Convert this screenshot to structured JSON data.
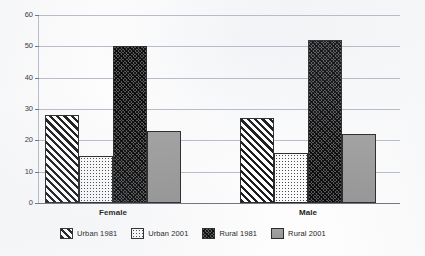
{
  "chart_data": {
    "type": "bar",
    "title": "",
    "subtitle": "",
    "xlabel": "",
    "ylabel": "",
    "categories": [
      "Female",
      "Male"
    ],
    "series": [
      {
        "name": "Urban 1981",
        "values": [
          28,
          27
        ],
        "pattern": "diagonal-hatch",
        "color": "#ffffff"
      },
      {
        "name": "Urban 2001",
        "values": [
          15,
          16
        ],
        "pattern": "fine-dots",
        "color": "#fbfbfb"
      },
      {
        "name": "Rural 1981",
        "values": [
          50,
          52
        ],
        "pattern": "dense-crosshatch",
        "color": "#585858"
      },
      {
        "name": "Rural 2001",
        "values": [
          23,
          22
        ],
        "pattern": "solid-gray",
        "color": "#9b9b9b"
      }
    ],
    "ylim": [
      0,
      60
    ],
    "yticks": [
      0,
      10,
      20,
      30,
      40,
      50,
      60
    ],
    "ytick_labels": [
      "0",
      "10",
      "20",
      "30",
      "40",
      "50",
      "60"
    ],
    "grid": true,
    "grid_axis": "y",
    "legend_position": "bottom"
  },
  "axis": {
    "y_ticks": [
      "0",
      "10",
      "20",
      "30",
      "40",
      "50",
      "60"
    ]
  },
  "groups": [
    {
      "label": "Female"
    },
    {
      "label": "Male"
    }
  ],
  "legend": {
    "items": [
      {
        "label": "Urban 1981",
        "swatch": "urban1981-swatch"
      },
      {
        "label": "Urban 2001",
        "swatch": "urban2001-swatch"
      },
      {
        "label": "Rural 1981",
        "swatch": "rural1981-swatch"
      },
      {
        "label": "Rural 2001",
        "swatch": "rural2001-swatch"
      }
    ]
  }
}
